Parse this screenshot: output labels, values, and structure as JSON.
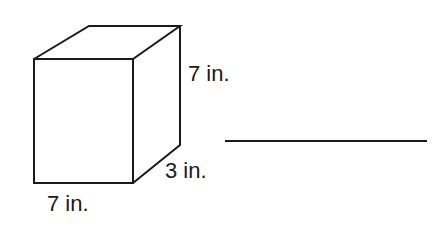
{
  "figure": {
    "shape": "rectangular prism",
    "dimensions": {
      "height": "7 in.",
      "depth": "3 in.",
      "width": "7 in."
    }
  },
  "answer": {
    "value": ""
  },
  "colors": {
    "stroke": "#1a1a1a",
    "background": "#ffffff"
  }
}
